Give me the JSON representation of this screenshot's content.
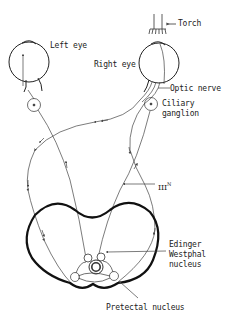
{
  "diagram": {
    "type": "pupillary light reflex pathway",
    "labels": {
      "torch": "Torch",
      "left_eye": "Left eye",
      "right_eye": "Right eye",
      "optic_nerve": "Optic nerve",
      "ciliary_ganglion_line1": "Ciliary",
      "ciliary_ganglion_line2": "ganglion",
      "third_nerve": "III",
      "third_nerve_sup": "N",
      "edinger_line1": "Edinger",
      "edinger_line2": "Westphal",
      "edinger_line3": "nucleus",
      "pretectal": "Pretectal nucleus"
    },
    "colors": {
      "line": "#333333",
      "outline": "#111111",
      "background": "#ffffff"
    }
  }
}
